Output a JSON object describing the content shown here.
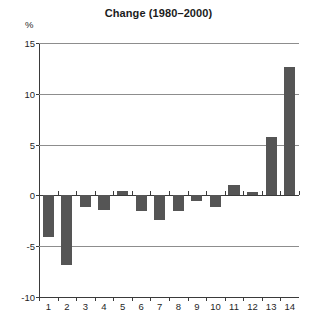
{
  "chart_data": {
    "type": "bar",
    "title": "Change (1980–2000)",
    "ylabel": "%",
    "xlabel": "",
    "categories": [
      "1",
      "2",
      "3",
      "4",
      "5",
      "6",
      "7",
      "8",
      "9",
      "10",
      "11",
      "12",
      "13",
      "14"
    ],
    "values": [
      -4.1,
      -6.9,
      -1.1,
      -1.4,
      0.4,
      -1.5,
      -2.4,
      -1.5,
      -0.6,
      -1.1,
      1.0,
      0.3,
      5.7,
      12.6
    ],
    "series": [
      {
        "name": "Change (1980–2000)",
        "values": [
          -4.1,
          -6.9,
          -1.1,
          -1.4,
          0.4,
          -1.5,
          -2.4,
          -1.5,
          -0.6,
          -1.1,
          1.0,
          0.3,
          5.7,
          12.6
        ]
      }
    ],
    "ylim": [
      -10,
      15
    ],
    "yticks": [
      15,
      10,
      5,
      0,
      -5,
      -10
    ],
    "ytick_labels": [
      "15",
      "10",
      "5",
      "0",
      "-5",
      "-10"
    ],
    "grid": true,
    "legend": false,
    "legend_position": "none",
    "bar_color": "#555555",
    "axis_color": "#3a3a3a",
    "gridline_color": "#8d8d8d",
    "background_color": "#ffffff"
  }
}
